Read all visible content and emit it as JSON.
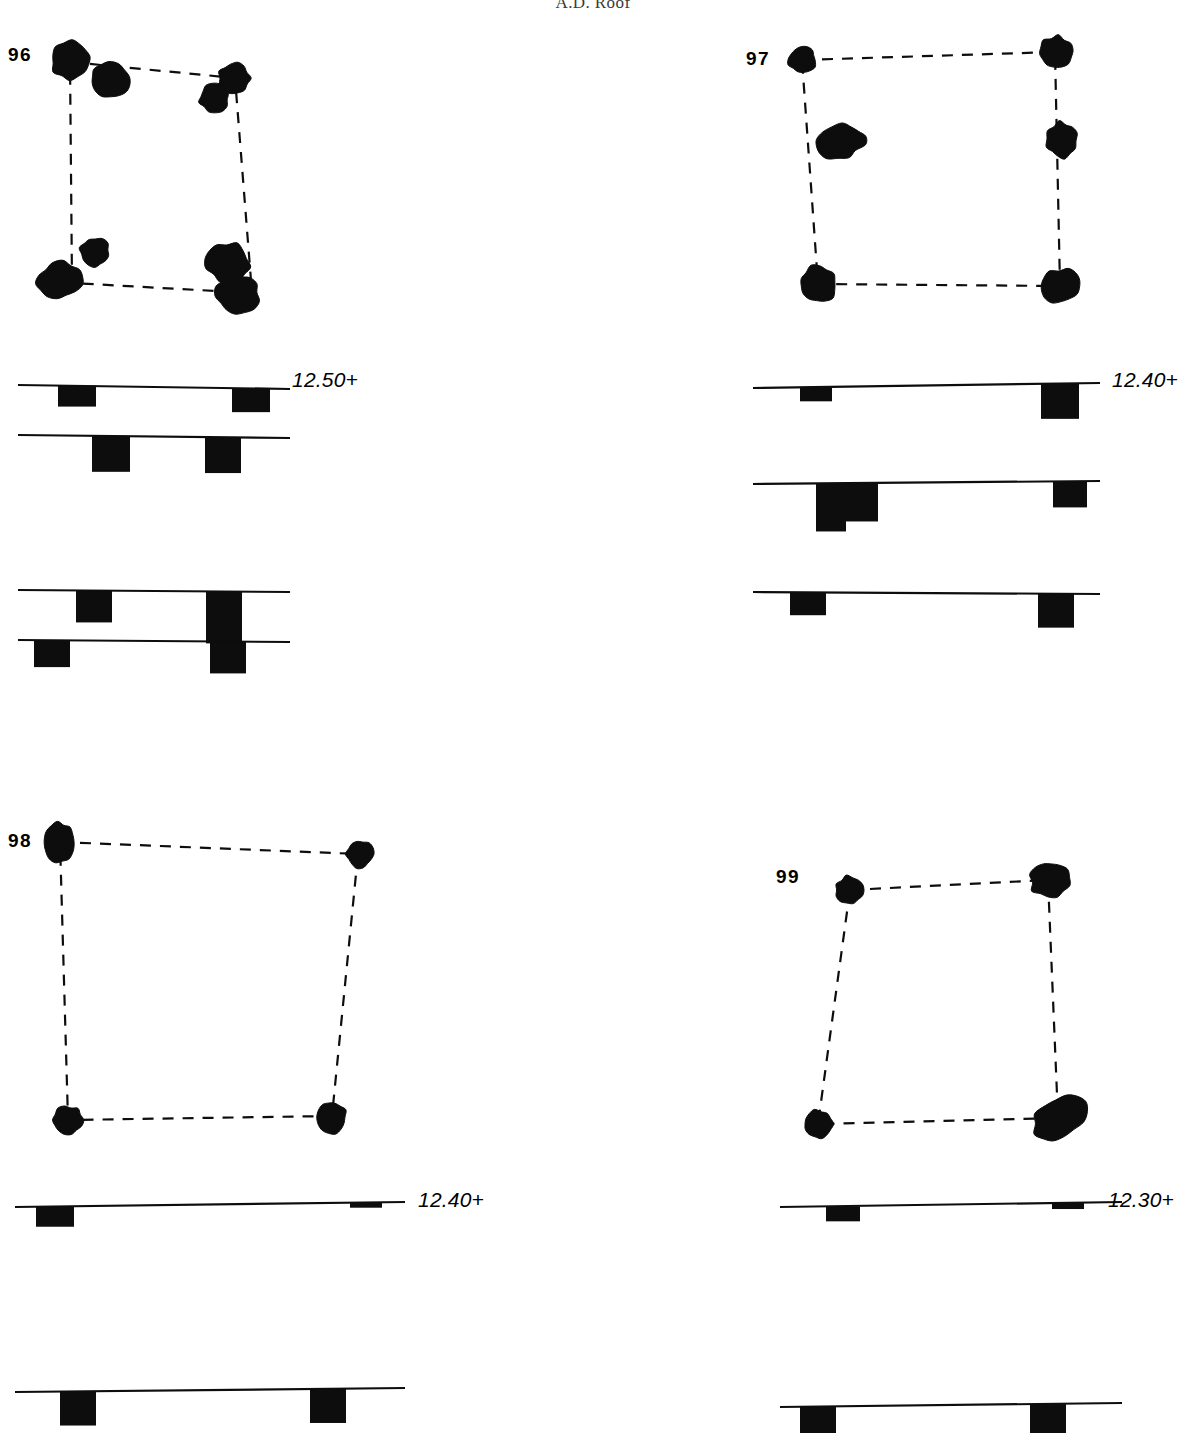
{
  "header": {
    "running_title": "A.D. Roof"
  },
  "figures": [
    {
      "id": "fig-96",
      "number": "96",
      "number_pos": {
        "x": 8,
        "y": 44
      },
      "plan": {
        "x": 20,
        "y": 30,
        "w": 300,
        "h": 290,
        "dashed_outline": [
          [
            50,
            32
          ],
          [
            215,
            48
          ],
          [
            232,
            263
          ],
          [
            52,
            253
          ]
        ],
        "features": [
          {
            "name": "posthole",
            "cx": 51,
            "cy": 30,
            "rx": 20,
            "ry": 19,
            "rot": -10
          },
          {
            "name": "posthole",
            "cx": 90,
            "cy": 50,
            "rx": 20,
            "ry": 17,
            "rot": 12
          },
          {
            "name": "posthole",
            "cx": 214,
            "cy": 48,
            "rx": 16,
            "ry": 15,
            "rot": 0
          },
          {
            "name": "posthole",
            "cx": 194,
            "cy": 68,
            "rx": 15,
            "ry": 14,
            "rot": 8
          },
          {
            "name": "posthole",
            "cx": 75,
            "cy": 222,
            "rx": 15,
            "ry": 14,
            "rot": 15
          },
          {
            "name": "posthole",
            "cx": 40,
            "cy": 250,
            "rx": 23,
            "ry": 18,
            "rot": -8
          },
          {
            "name": "posthole",
            "cx": 208,
            "cy": 233,
            "rx": 22,
            "ry": 20,
            "rot": 10
          },
          {
            "name": "posthole",
            "cx": 218,
            "cy": 264,
            "rx": 22,
            "ry": 20,
            "rot": -5
          }
        ]
      },
      "sections": [
        {
          "x": 10,
          "y": 375,
          "w": 360,
          "h": 70,
          "ground": [
            [
              8,
              10
            ],
            [
              280,
              14
            ]
          ],
          "cuts": [
            {
              "x": 48,
              "w": 38,
              "top": 11,
              "depth": 21
            },
            {
              "x": 222,
              "w": 38,
              "top": 13,
              "depth": 24
            }
          ]
        },
        {
          "x": 10,
          "y": 425,
          "w": 360,
          "h": 70,
          "ground": [
            [
              8,
              10
            ],
            [
              280,
              13
            ]
          ],
          "cuts": [
            {
              "x": 82,
              "w": 38,
              "top": 11,
              "depth": 36
            },
            {
              "x": 195,
              "w": 36,
              "top": 12,
              "depth": 36
            }
          ]
        },
        {
          "x": 10,
          "y": 580,
          "w": 360,
          "h": 70,
          "ground": [
            [
              8,
              10
            ],
            [
              280,
              12
            ]
          ],
          "cuts": [
            {
              "x": 66,
              "w": 36,
              "top": 11,
              "depth": 32
            },
            {
              "x": 196,
              "w": 36,
              "top": 11,
              "depth": 52
            }
          ]
        },
        {
          "x": 10,
          "y": 630,
          "w": 360,
          "h": 70,
          "ground": [
            [
              8,
              10
            ],
            [
              280,
              12
            ]
          ],
          "cuts": [
            {
              "x": 24,
              "w": 36,
              "top": 11,
              "depth": 27
            },
            {
              "x": 200,
              "w": 36,
              "top": 12,
              "depth": 32
            }
          ]
        }
      ],
      "elevation": {
        "text": "12.50+",
        "x": 292,
        "y": 368
      }
    },
    {
      "id": "fig-97",
      "number": "97",
      "number_pos": {
        "x": 746,
        "y": 48
      },
      "plan": {
        "x": 760,
        "y": 30,
        "w": 330,
        "h": 290,
        "dashed_outline": [
          [
            42,
            30
          ],
          [
            295,
            22
          ],
          [
            300,
            256
          ],
          [
            58,
            254
          ]
        ],
        "features": [
          {
            "name": "posthole",
            "cx": 42,
            "cy": 30,
            "rx": 14,
            "ry": 13,
            "rot": 5
          },
          {
            "name": "posthole",
            "cx": 296,
            "cy": 22,
            "rx": 17,
            "ry": 16,
            "rot": -6
          },
          {
            "name": "posthole",
            "cx": 80,
            "cy": 112,
            "rx": 25,
            "ry": 17,
            "rot": -12
          },
          {
            "name": "posthole",
            "cx": 302,
            "cy": 110,
            "rx": 16,
            "ry": 18,
            "rot": 4
          },
          {
            "name": "posthole",
            "cx": 58,
            "cy": 254,
            "rx": 19,
            "ry": 19,
            "rot": 18
          },
          {
            "name": "posthole",
            "cx": 300,
            "cy": 256,
            "rx": 21,
            "ry": 17,
            "rot": -20
          }
        ]
      },
      "sections": [
        {
          "x": 748,
          "y": 375,
          "w": 380,
          "h": 70,
          "ground": [
            [
              5,
              13
            ],
            [
              352,
              8
            ]
          ],
          "cuts": [
            {
              "x": 52,
              "w": 32,
              "top": 11,
              "depth": 14
            },
            {
              "x": 293,
              "w": 38,
              "top": 9,
              "depth": 35
            }
          ]
        },
        {
          "x": 748,
          "y": 470,
          "w": 380,
          "h": 70,
          "ground": [
            [
              5,
              14
            ],
            [
              352,
              11
            ]
          ],
          "cuts": [
            {
              "x": 68,
              "w": 62,
              "top": 13,
              "depth": 38
            },
            {
              "x": 68,
              "w": 30,
              "top": 13,
              "depth": 48
            },
            {
              "x": 305,
              "w": 34,
              "top": 11,
              "depth": 26
            }
          ]
        },
        {
          "x": 748,
          "y": 580,
          "w": 380,
          "h": 70,
          "ground": [
            [
              5,
              12
            ],
            [
              352,
              14
            ]
          ],
          "cuts": [
            {
              "x": 42,
              "w": 36,
              "top": 11,
              "depth": 23
            },
            {
              "x": 290,
              "w": 36,
              "top": 13,
              "depth": 34
            }
          ]
        }
      ],
      "elevation": {
        "text": "12.40+",
        "x": 1112,
        "y": 368
      }
    },
    {
      "id": "fig-98",
      "number": "98",
      "number_pos": {
        "x": 8,
        "y": 830
      },
      "plan": {
        "x": 20,
        "y": 820,
        "w": 380,
        "h": 320,
        "dashed_outline": [
          [
            40,
            22
          ],
          [
            338,
            34
          ],
          [
            312,
            296
          ],
          [
            48,
            300
          ]
        ],
        "features": [
          {
            "name": "posthole",
            "cx": 40,
            "cy": 22,
            "rx": 15,
            "ry": 20,
            "rot": 3
          },
          {
            "name": "posthole",
            "cx": 340,
            "cy": 34,
            "rx": 14,
            "ry": 14,
            "rot": 0
          },
          {
            "name": "posthole",
            "cx": 48,
            "cy": 300,
            "rx": 15,
            "ry": 14,
            "rot": 0
          },
          {
            "name": "posthole",
            "cx": 312,
            "cy": 297,
            "rx": 15,
            "ry": 16,
            "rot": 0
          }
        ]
      },
      "sections": [
        {
          "x": 10,
          "y": 1185,
          "w": 430,
          "h": 70,
          "ground": [
            [
              5,
              22
            ],
            [
              395,
              17
            ]
          ],
          "cuts": [
            {
              "x": 26,
              "w": 38,
              "top": 21,
              "depth": 20
            },
            {
              "x": 340,
              "w": 32,
              "top": 18,
              "depth": 5
            }
          ]
        },
        {
          "x": 10,
          "y": 1378,
          "w": 430,
          "h": 50,
          "ground": [
            [
              5,
              14
            ],
            [
              395,
              10
            ]
          ],
          "cuts": [
            {
              "x": 50,
              "w": 36,
              "top": 13,
              "depth": 34
            },
            {
              "x": 300,
              "w": 36,
              "top": 11,
              "depth": 34
            }
          ]
        }
      ],
      "elevation": {
        "text": "12.40+",
        "x": 418,
        "y": 1188
      }
    },
    {
      "id": "fig-99",
      "number": "99",
      "number_pos": {
        "x": 776,
        "y": 866
      },
      "plan": {
        "x": 790,
        "y": 850,
        "w": 360,
        "h": 310,
        "dashed_outline": [
          [
            60,
            40
          ],
          [
            258,
            30
          ],
          [
            268,
            268
          ],
          [
            28,
            274
          ]
        ],
        "features": [
          {
            "name": "posthole",
            "cx": 60,
            "cy": 40,
            "rx": 15,
            "ry": 14,
            "rot": 0
          },
          {
            "name": "posthole",
            "cx": 260,
            "cy": 30,
            "rx": 20,
            "ry": 18,
            "rot": -8
          },
          {
            "name": "posthole",
            "cx": 28,
            "cy": 274,
            "rx": 15,
            "ry": 14,
            "rot": 0
          },
          {
            "name": "posthole",
            "cx": 270,
            "cy": 268,
            "rx": 28,
            "ry": 20,
            "rot": -32
          }
        ]
      },
      "sections": [
        {
          "x": 770,
          "y": 1185,
          "w": 400,
          "h": 70,
          "ground": [
            [
              10,
              22
            ],
            [
              352,
              17
            ]
          ],
          "cuts": [
            {
              "x": 56,
              "w": 34,
              "top": 21,
              "depth": 15
            },
            {
              "x": 282,
              "w": 32,
              "top": 18,
              "depth": 6
            }
          ]
        },
        {
          "x": 770,
          "y": 1393,
          "w": 400,
          "h": 40,
          "ground": [
            [
              10,
              14
            ],
            [
              352,
              10
            ]
          ],
          "cuts": [
            {
              "x": 30,
              "w": 36,
              "top": 13,
              "depth": 30
            },
            {
              "x": 260,
              "w": 36,
              "top": 11,
              "depth": 30
            }
          ]
        }
      ],
      "elevation": {
        "text": "12.30+",
        "x": 1108,
        "y": 1188
      }
    }
  ],
  "style": {
    "ink": "#0d0d0d",
    "dash_pattern": "11 9",
    "dash_width": 2.2,
    "ground_line_width": 2.2
  }
}
